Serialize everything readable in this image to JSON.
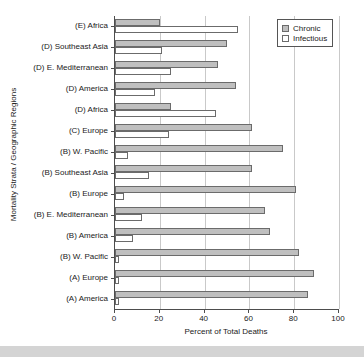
{
  "chart_data": {
    "type": "bar",
    "orientation": "horizontal",
    "title": "",
    "xlabel": "Percent of Total Deaths",
    "ylabel": "Mortality Strata / Geographic Regions",
    "xlim": [
      0,
      100
    ],
    "xticks": [
      0,
      20,
      40,
      60,
      80,
      100
    ],
    "grid": true,
    "legend_position": "top-right",
    "categories": [
      "(E) Africa",
      "(D) Southeast Asia",
      "(D) E. Mediterranean",
      "(D) America",
      "(D) Africa",
      "(C) Europe",
      "(B) W. Pacific",
      "(B) Southeast Asia",
      "(B) Europe",
      "(B) E. Mediterranean",
      "(B) America",
      "(B) W. Pacific",
      "(A) Europe",
      "(A) America"
    ],
    "series": [
      {
        "name": "Chronic",
        "color": "#bfbfbf",
        "values": [
          20,
          50,
          46,
          54,
          25,
          61,
          75,
          61,
          81,
          67,
          69,
          82,
          89,
          86
        ]
      },
      {
        "name": "Infectious",
        "color": "#ffffff",
        "values": [
          55,
          21,
          25,
          18,
          45,
          24,
          6,
          15,
          4,
          12,
          8,
          2,
          2,
          2
        ]
      }
    ]
  },
  "legend": {
    "items": [
      {
        "label": "Chronic",
        "swatch": "chronic"
      },
      {
        "label": "Infectious",
        "swatch": "infectious"
      }
    ]
  }
}
